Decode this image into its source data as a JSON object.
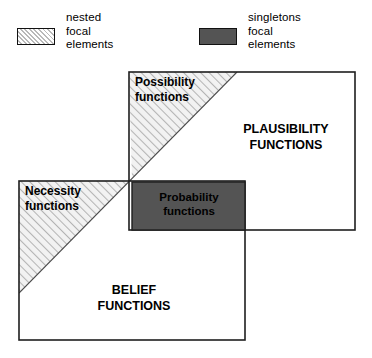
{
  "figure": {
    "type": "venn-style-region-diagram",
    "title": "",
    "background": "#ffffff",
    "stroke_color": "#1a1a1a",
    "hatch_fill": "#f2f2f2",
    "hatch_line_color": "#b9b9b9",
    "solid_fill": "#545454"
  },
  "legend": {
    "items": [
      {
        "id": "nested-focal-elements",
        "swatch": "hatched-swatch",
        "pattern": "diagonal-hatch",
        "label": "nested\nfocal\nelements"
      },
      {
        "id": "singletons-focal-elements",
        "swatch": "solid-swatch",
        "pattern": "solid-dark-gray",
        "color": "#545454",
        "label": "singletons\nfocal\nelements"
      }
    ]
  },
  "regions": {
    "plausibility": {
      "label": "PLAUSIBILITY\nFUNCTIONS",
      "style": "outlined-rectangle"
    },
    "belief": {
      "label": "BELIEF\nFUNCTIONS",
      "style": "outlined-rectangle"
    },
    "possibility": {
      "label": "Possibility\nfunctions",
      "style": "hatched-band"
    },
    "necessity": {
      "label": "Necessity\nfunctions",
      "style": "hatched-band"
    },
    "probability": {
      "label": "Probability\nfunctions",
      "style": "solid-dark-rectangle",
      "color": "#545454"
    }
  }
}
